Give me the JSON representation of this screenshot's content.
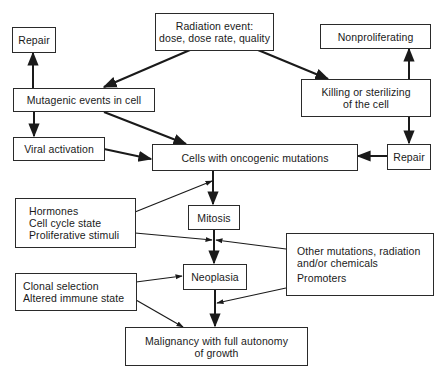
{
  "nodes": {
    "repair_left": {
      "lines": [
        "Repair"
      ]
    },
    "radiation_event": {
      "lines": [
        "Radiation event:",
        "dose, dose rate, quality"
      ]
    },
    "nonproliferating": {
      "lines": [
        "Nonproliferating"
      ]
    },
    "mutagenic_events": {
      "lines": [
        "Mutagenic events in cell"
      ]
    },
    "killing_sterilizing": {
      "lines": [
        "Killing or sterilizing",
        "of the cell"
      ]
    },
    "viral_activation": {
      "lines": [
        "Viral activation"
      ]
    },
    "oncogenic_cells": {
      "lines": [
        "Cells with oncogenic mutations"
      ]
    },
    "repair_right": {
      "lines": [
        "Repair"
      ]
    },
    "hormones": {
      "lines": [
        "Hormones",
        "Cell cycle state",
        "Proliferative stimuli"
      ]
    },
    "mitosis": {
      "lines": [
        "Mitosis"
      ]
    },
    "other_mutations": {
      "lines": [
        "Other mutations, radiation",
        "and/or chemicals",
        "Promoters"
      ]
    },
    "neoplasia": {
      "lines": [
        "Neoplasia"
      ]
    },
    "clonal_selection": {
      "lines": [
        "Clonal selection",
        "Altered immune state"
      ]
    },
    "malignancy": {
      "lines": [
        "Malignancy with full autonomy",
        "of growth"
      ]
    }
  },
  "edges": [
    {
      "from": "radiation_event",
      "to": "mutagenic_events"
    },
    {
      "from": "radiation_event",
      "to": "killing_sterilizing"
    },
    {
      "from": "mutagenic_events",
      "to": "repair_left"
    },
    {
      "from": "mutagenic_events",
      "to": "viral_activation"
    },
    {
      "from": "mutagenic_events",
      "to": "oncogenic_cells"
    },
    {
      "from": "viral_activation",
      "to": "oncogenic_cells"
    },
    {
      "from": "killing_sterilizing",
      "to": "nonproliferating"
    },
    {
      "from": "killing_sterilizing",
      "to": "repair_right"
    },
    {
      "from": "repair_right",
      "to": "oncogenic_cells"
    },
    {
      "from": "oncogenic_cells",
      "to": "mitosis"
    },
    {
      "from": "hormones",
      "to": "oncogenic_cells-mitosis-link"
    },
    {
      "from": "hormones",
      "to": "mitosis-neoplasia-link"
    },
    {
      "from": "other_mutations",
      "to": "mitosis-neoplasia-link"
    },
    {
      "from": "mitosis",
      "to": "neoplasia"
    },
    {
      "from": "clonal_selection",
      "to": "neoplasia"
    },
    {
      "from": "clonal_selection",
      "to": "malignancy"
    },
    {
      "from": "other_mutations",
      "to": "neoplasia-malignancy-link"
    },
    {
      "from": "neoplasia",
      "to": "malignancy"
    }
  ]
}
